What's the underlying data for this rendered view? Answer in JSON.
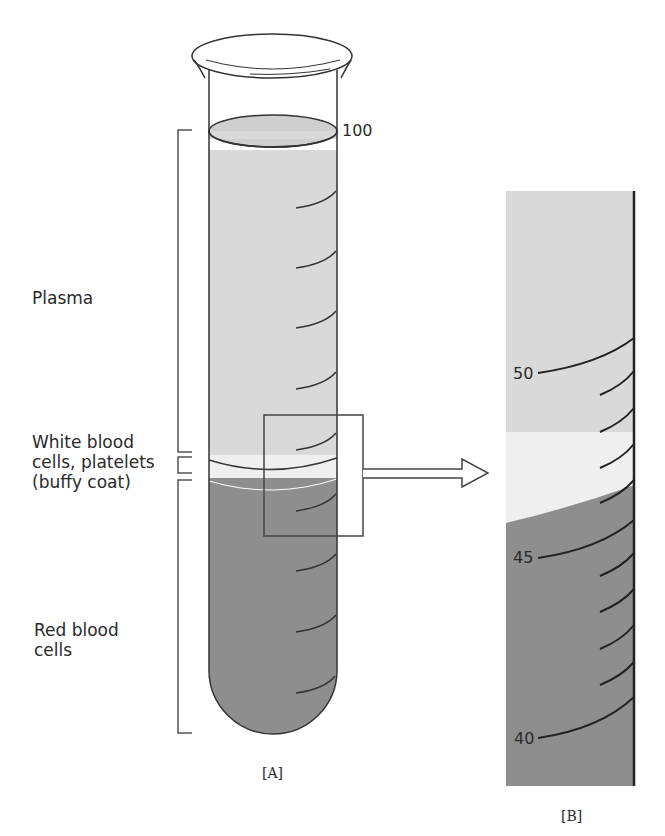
{
  "figure": {
    "panel_a": {
      "caption": "[A]",
      "scale_top_label": "100",
      "layers": [
        {
          "name": "Plasma",
          "label": "Plasma",
          "color": "#d9d9d9"
        },
        {
          "name": "Buffy coat",
          "label": "White blood\ncells, platelets\n(buffy coat)",
          "color": "#efefef"
        },
        {
          "name": "Red blood cells",
          "label": "Red blood\ncells",
          "color": "#8e8e8e"
        }
      ]
    },
    "panel_b": {
      "caption": "[B]",
      "scale_labels": [
        "50",
        "45",
        "40"
      ],
      "colors": {
        "plasma": "#d9d9d9",
        "buffy": "#efefef",
        "rbc": "#8e8e8e"
      }
    }
  }
}
